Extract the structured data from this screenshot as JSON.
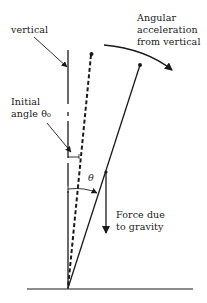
{
  "diagram": {
    "labels": {
      "vertical": "vertical",
      "angular_acceleration": [
        "Angular",
        "acceleration",
        "from vertical"
      ],
      "initial_angle": [
        "Initial",
        "angle θ₀"
      ],
      "theta": "θ",
      "force_gravity": [
        "Force due",
        "to gravity"
      ]
    },
    "colors": {
      "stroke": "#1a1a1a",
      "background": "#ffffff"
    }
  }
}
